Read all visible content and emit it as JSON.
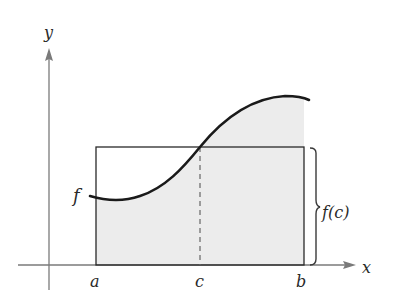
{
  "diagram": {
    "axes": {
      "x_label": "x",
      "y_label": "y"
    },
    "function_label": "f",
    "points": {
      "a": "a",
      "c": "c",
      "b": "b"
    },
    "height_label": "f(c)",
    "colors": {
      "curve": "#1a1a1a",
      "axis": "#7a7a7a",
      "rectangle": "#2a2a2a",
      "shade": "#ececec",
      "dashed": "#666666"
    }
  }
}
